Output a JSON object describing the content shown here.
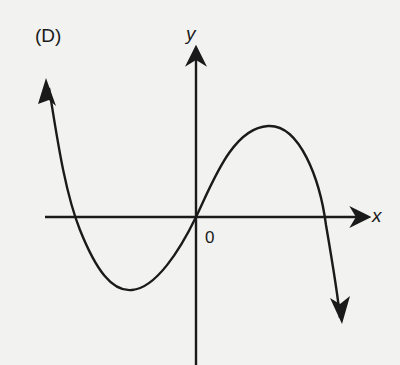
{
  "panel_label": "(D)",
  "axes": {
    "x_label": "x",
    "y_label": "y",
    "origin_label": "0"
  },
  "colors": {
    "background": "#f2f2f0",
    "ink": "#1a1a1a"
  },
  "curve": {
    "description": "Cubic with negative leading coefficient: rises from upper-left (arrow), crosses x-axis left of origin, local minimum in quadrant III, passes through origin, local maximum in quadrant I, crosses x-axis again, descends to lower-right (arrow)",
    "shape": "y = -k x (x - a)(x + b)",
    "end_behavior": {
      "left": "up",
      "right": "down"
    },
    "x_intercepts": [
      "negative",
      "0",
      "positive"
    ],
    "local_min": "quadrant III",
    "local_max": "quadrant I"
  }
}
